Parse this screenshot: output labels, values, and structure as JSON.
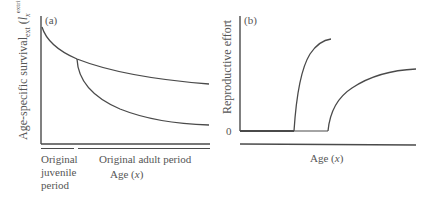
{
  "panel_a": {
    "label": "(a)",
    "y_axis_label_main": "Age-specific survival",
    "y_axis_label_sub": "ext",
    "y_axis_label_paren_open": " (",
    "y_axis_label_l": "l",
    "y_axis_label_x": "x",
    "y_axis_label_sup": "extrinsic",
    "y_axis_label_paren_close": ")",
    "juvenile_label_line1": "Original",
    "juvenile_label_line2": "juvenile",
    "juvenile_label_line3": "period",
    "adult_label": "Original adult period",
    "x_axis_label_prefix": "Age (",
    "x_axis_label_var": "x",
    "x_axis_label_suffix": ")"
  },
  "panel_b": {
    "label": "(b)",
    "y_axis_label": "Reproductive effort",
    "zero_tick": "0",
    "x_axis_label_prefix": "Age (",
    "x_axis_label_var": "x",
    "x_axis_label_suffix": ")"
  },
  "colors": {
    "line": "#4a4a4a",
    "text": "#555555"
  }
}
